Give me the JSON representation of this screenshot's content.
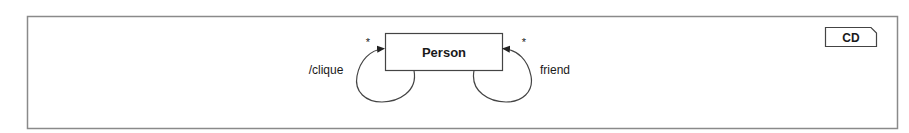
{
  "diagram": {
    "type": "UML class diagram",
    "tag": "CD",
    "classes": [
      {
        "id": "person",
        "name": "Person"
      }
    ],
    "associations": [
      {
        "id": "clique",
        "name": "/clique",
        "source": "Person",
        "target": "Person",
        "multiplicity": "*",
        "derived": true,
        "side": "left"
      },
      {
        "id": "friend",
        "name": "friend",
        "source": "Person",
        "target": "Person",
        "multiplicity": "*",
        "derived": false,
        "side": "right"
      }
    ]
  },
  "colors": {
    "line": "#555555",
    "frame": "#8a8a8a",
    "text": "#1a1a1a",
    "background": "#ffffff"
  }
}
